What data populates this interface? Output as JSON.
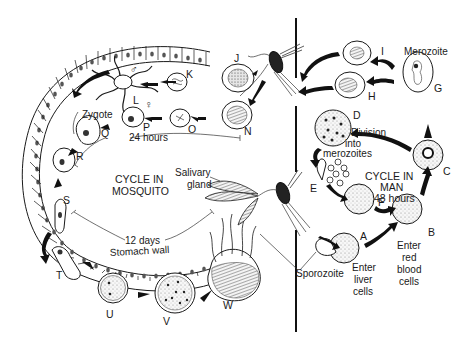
{
  "diagram": {
    "sections": {
      "mosquito": {
        "line1": "CYCLE IN",
        "line2": "MOSQUITO"
      },
      "man": {
        "line1": "CYCLE IN",
        "line2": "MAN",
        "line3": "48 hours"
      }
    },
    "durations": {
      "short": "24 hours",
      "long": "12 days"
    },
    "structures": {
      "stomach_wall": "Stomach wall",
      "salivary_gland_1": "Salivary",
      "salivary_gland_2": "gland",
      "zygote": "Zygote",
      "merozoite": "Merozoite",
      "sporozoite": "Sporozoite"
    },
    "annotations": {
      "division_1": "Division",
      "division_2": "into",
      "division_3": "merozoites",
      "liver_1": "Enter",
      "liver_2": "liver",
      "liver_3": "cells",
      "rbc_1": "Enter",
      "rbc_2": "red",
      "rbc_3": "blood",
      "rbc_4": "cells"
    },
    "symbols": {
      "male": "♂",
      "female": "♀"
    },
    "stages": {
      "A": "A",
      "B": "B",
      "C": "C",
      "D": "D",
      "E": "E",
      "F": "F",
      "G": "G",
      "H": "H",
      "I": "I",
      "J": "J",
      "K": "K",
      "L": "L",
      "N": "N",
      "O": "O",
      "P": "P",
      "Q": "Q",
      "R": "R",
      "S": "S",
      "T": "T",
      "U": "U",
      "V": "V",
      "W": "W"
    },
    "colors": {
      "ink": "#1a1a1a",
      "background": "#ffffff"
    }
  }
}
